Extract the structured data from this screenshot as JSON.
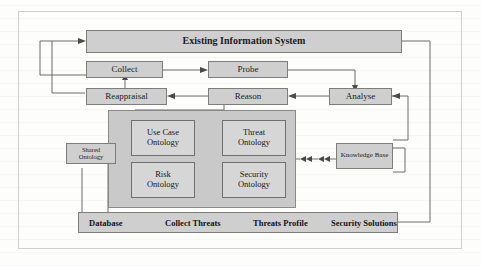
{
  "diagram": {
    "title_box": {
      "label": "Existing Information System"
    },
    "process_boxes": [
      {
        "id": "collect",
        "label": "Collect"
      },
      {
        "id": "probe",
        "label": "Probe"
      },
      {
        "id": "reappraisal",
        "label": "Reappraisal"
      },
      {
        "id": "reason",
        "label": "Reason"
      },
      {
        "id": "analyse",
        "label": "Analyse"
      },
      {
        "id": "knowledge-base",
        "label": "Knowledge Base"
      },
      {
        "id": "shared-ontology",
        "label": "Shared\nOntology"
      }
    ],
    "shared_ontology": {
      "line1": "Shared",
      "line2": "Ontology"
    },
    "knowledge_base": {
      "label": "Knowledge Base"
    },
    "ontology_group": {
      "items": [
        {
          "id": "use-case-ontology",
          "line1": "Use Case",
          "line2": "Ontology"
        },
        {
          "id": "threat-ontology",
          "line1": "Threat",
          "line2": "Ontology"
        },
        {
          "id": "risk-ontology",
          "line1": "Risk",
          "line2": "Ontology"
        },
        {
          "id": "security-ontology",
          "line1": "Security",
          "line2": "Ontology"
        }
      ]
    },
    "bottom_bar": {
      "items": [
        {
          "id": "database",
          "label": "Database"
        },
        {
          "id": "collect-threats",
          "label": "Collect Threats"
        },
        {
          "id": "threats-profile",
          "label": "Threats Profile"
        },
        {
          "id": "security-solutions",
          "label": "Security Solutions"
        }
      ]
    },
    "colors": {
      "box_fill": "#cfcfcf",
      "box_border": "#7d7d7d",
      "group_fill": "#c9c9c9",
      "inner_fill": "#d6d6d6",
      "wire": "#6b6b6b",
      "arrow_fill": "#dcdcdc",
      "page_bg": "#fdfdfc"
    }
  }
}
